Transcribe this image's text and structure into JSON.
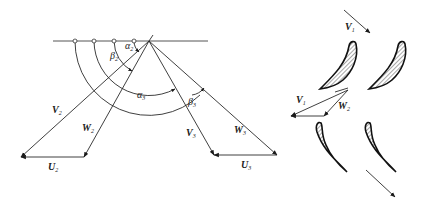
{
  "figure": {
    "title": "",
    "velocity_triangles": {
      "labels": {
        "V2": {
          "main": "V",
          "sub": "2"
        },
        "W2": {
          "main": "W",
          "sub": "2"
        },
        "U2": {
          "main": "U",
          "sub": "2"
        },
        "V3": {
          "main": "V",
          "sub": "3"
        },
        "W3": {
          "main": "W",
          "sub": "3"
        },
        "U3": {
          "main": "U",
          "sub": "3"
        },
        "alpha2": {
          "main": "α",
          "sub": "2"
        },
        "beta2": {
          "main": "β",
          "sub": "2"
        },
        "alpha3": {
          "main": "α",
          "sub": "3"
        },
        "beta3": {
          "main": "β",
          "sub": "3"
        }
      }
    },
    "blade_cascade": {
      "labels": {
        "V1_inlet": {
          "main": "V",
          "sub": "1"
        },
        "V1_mid": {
          "main": "V",
          "sub": "1"
        },
        "W2_mid": {
          "main": "W",
          "sub": "2"
        }
      },
      "blade_count": 4
    },
    "colors": {
      "line": "#2a2a2a",
      "background": "#ffffff"
    }
  }
}
